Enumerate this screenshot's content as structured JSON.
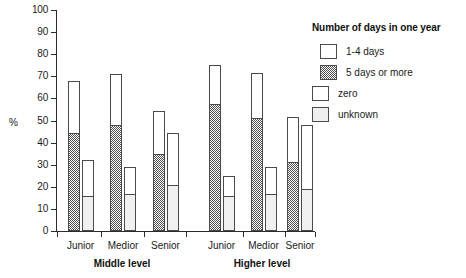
{
  "chart_data": {
    "type": "bar",
    "title": "",
    "subtitle": "",
    "xlabel": "",
    "ylabel": "%",
    "ylim": [
      0,
      100
    ],
    "ytick_labels": [
      "0",
      "10",
      "20",
      "30",
      "40",
      "50",
      "60",
      "70",
      "80",
      "90",
      "100"
    ],
    "ytick_values": [
      0,
      10,
      20,
      30,
      40,
      50,
      60,
      70,
      80,
      90,
      100
    ],
    "grid": false,
    "stacked": true,
    "legend_position": "right",
    "legend_title": "Number of days in one year",
    "legend_entries": [
      {
        "label": "1-4 days",
        "pattern": "white",
        "color": "#ffffff"
      },
      {
        "label": "5 days or more",
        "pattern": "dark-checker",
        "color": "#4f4f4f"
      },
      {
        "label": "zero",
        "pattern": "white",
        "color": "#ffffff"
      },
      {
        "label": "unknown",
        "pattern": "light-stipple",
        "color": "#efefef"
      }
    ],
    "group_labels": [
      "Middle level",
      "Higher level"
    ],
    "categories": [
      "Junior",
      "Medior",
      "Senior",
      "Junior",
      "Medior",
      "Senior"
    ],
    "groups": [
      {
        "group": "Middle level",
        "bars": [
          {
            "category": "Junior",
            "pair": [
              {
                "total": 68.0,
                "bottom_label": "5 days or more",
                "bottom": 44.0,
                "top_label": "1-4 days",
                "top": 24.0
              },
              {
                "total": 32.0,
                "bottom_label": "unknown",
                "bottom": 15.5,
                "top_label": "zero",
                "top": 16.5
              }
            ]
          },
          {
            "category": "Medior",
            "pair": [
              {
                "total": 71.0,
                "bottom_label": "5 days or more",
                "bottom": 47.5,
                "top_label": "1-4 days",
                "top": 23.5
              },
              {
                "total": 29.0,
                "bottom_label": "unknown",
                "bottom": 16.5,
                "top_label": "zero",
                "top": 12.5
              }
            ]
          },
          {
            "category": "Senior",
            "pair": [
              {
                "total": 54.5,
                "bottom_label": "5 days or more",
                "bottom": 34.5,
                "top_label": "1-4 days",
                "top": 20.0
              },
              {
                "total": 44.5,
                "bottom_label": "unknown",
                "bottom": 20.5,
                "top_label": "zero",
                "top": 24.0
              }
            ]
          }
        ]
      },
      {
        "group": "Higher level",
        "bars": [
          {
            "category": "Junior",
            "pair": [
              {
                "total": 75.0,
                "bottom_label": "5 days or more",
                "bottom": 57.0,
                "top_label": "1-4 days",
                "top": 18.0
              },
              {
                "total": 25.0,
                "bottom_label": "unknown",
                "bottom": 15.5,
                "top_label": "zero",
                "top": 9.5
              }
            ]
          },
          {
            "category": "Medior",
            "pair": [
              {
                "total": 71.5,
                "bottom_label": "5 days or more",
                "bottom": 50.5,
                "top_label": "1-4 days",
                "top": 21.0
              },
              {
                "total": 29.0,
                "bottom_label": "unknown",
                "bottom": 16.5,
                "top_label": "zero",
                "top": 12.5
              }
            ]
          },
          {
            "category": "Senior",
            "pair": [
              {
                "total": 51.5,
                "bottom_label": "5 days or more",
                "bottom": 31.0,
                "top_label": "1-4 days",
                "top": 20.5
              },
              {
                "total": 48.0,
                "bottom_label": "unknown",
                "bottom": 18.5,
                "top_label": "zero",
                "top": 29.5
              }
            ]
          }
        ]
      }
    ]
  },
  "axis": {
    "y_title": "%",
    "ticks": [
      "100",
      "90",
      "80",
      "70",
      "60",
      "50",
      "40",
      "30",
      "20",
      "10",
      "0"
    ]
  },
  "legend": {
    "title": "Number of days in one year",
    "items": [
      {
        "label": "1-4 days"
      },
      {
        "label": "5 days or more"
      },
      {
        "label": "zero"
      },
      {
        "label": "unknown"
      }
    ]
  },
  "xaxis": {
    "categories": [
      "Junior",
      "Medior",
      "Senior",
      "Junior",
      "Medior",
      "Senior"
    ],
    "groups": [
      "Middle level",
      "Higher level"
    ]
  }
}
